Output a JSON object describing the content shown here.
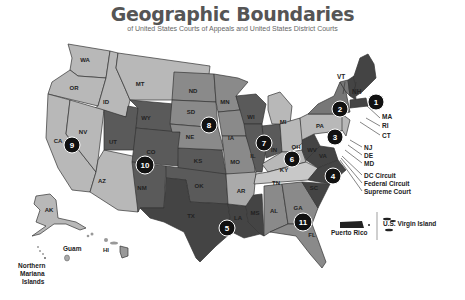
{
  "header": {
    "title": "Geographic Boundaries",
    "subtitle": "of United States Courts of Appeals and United States District Courts"
  },
  "colors": {
    "light": "#b8b8b8",
    "mid": "#8a8a8a",
    "dark": "#5a5a5a",
    "darker": "#444444",
    "badge": "#111111"
  },
  "states": {
    "WA": "WA",
    "OR": "OR",
    "ID": "ID",
    "MT": "MT",
    "CA": "CA",
    "NV": "NV",
    "AZ": "AZ",
    "UT": "UT",
    "WY": "WY",
    "CO": "CO",
    "NM": "NM",
    "ND": "ND",
    "SD": "SD",
    "NE": "NE",
    "KS": "KS",
    "OK": "OK",
    "TX": "TX",
    "MN": "MN",
    "IA": "IA",
    "MO": "MO",
    "AR": "AR",
    "LA": "LA",
    "MS": "MS",
    "WI": "WI",
    "IL": "IL",
    "IN": "IN",
    "MI": "MI",
    "OH": "OH",
    "KY": "KY",
    "TN": "TN",
    "AL": "AL",
    "GA": "GA",
    "FL": "FL",
    "PA": "PA",
    "NY": "NY",
    "WV": "WV",
    "VA": "VA",
    "NC": "NC",
    "SC": "SC",
    "AK": "AK",
    "HI": "HI"
  },
  "callouts": {
    "VT": "VT",
    "NH": "NH",
    "MA": "MA",
    "RI": "RI",
    "CT": "CT",
    "NJ": "NJ",
    "DE": "DE",
    "MD": "MD",
    "dc": "DC Circuit",
    "federal": "Federal Circuit",
    "supreme": "Supreme Court"
  },
  "territories": {
    "guam": "Guam",
    "nmi_line1": "Northern",
    "nmi_line2": "Mariana",
    "nmi_line3": "Islands",
    "pr": "Puerto Rico",
    "vi": "U.S. Virgin Island"
  },
  "circuits": [
    "1",
    "2",
    "3",
    "4",
    "5",
    "6",
    "7",
    "8",
    "9",
    "10",
    "11"
  ]
}
